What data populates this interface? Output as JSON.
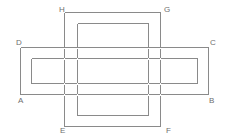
{
  "figure": {
    "type": "line-drawing",
    "stroke_color": "#8a8a8a",
    "stroke_color_dark": "#6f6f6f",
    "background_color": "#ffffff",
    "stroke_width": 1,
    "canvas": {
      "width": 225,
      "height": 138
    },
    "labels": [
      {
        "name": "A",
        "text": "A",
        "x": 19,
        "y": 96
      },
      {
        "name": "B",
        "text": "B",
        "x": 210,
        "y": 96
      },
      {
        "name": "C",
        "text": "C",
        "x": 211,
        "y": 38
      },
      {
        "name": "D",
        "text": "D",
        "x": 17,
        "y": 38
      },
      {
        "name": "E",
        "text": "E",
        "x": 62,
        "y": 126
      },
      {
        "name": "F",
        "text": "F",
        "x": 166,
        "y": 126
      },
      {
        "name": "G",
        "text": "G",
        "x": 165,
        "y": 10
      },
      {
        "name": "H",
        "text": "H",
        "x": 59,
        "y": 10
      }
    ],
    "rectangles": [
      {
        "name": "outer-horizontal-band",
        "corners": "D-C-B-A",
        "x1": 20,
        "y1": 47,
        "x2": 208,
        "y2": 94
      },
      {
        "name": "inner-horizontal-band",
        "corners": "inner",
        "x1": 31,
        "y1": 58,
        "x2": 197,
        "y2": 83
      },
      {
        "name": "outer-vertical-band",
        "corners": "H-G-F-E",
        "x1": 64,
        "y1": 12,
        "x2": 160,
        "y2": 126
      },
      {
        "name": "inner-vertical-band",
        "corners": "inner",
        "x1": 77,
        "y1": 23,
        "x2": 148,
        "y2": 115
      }
    ]
  }
}
